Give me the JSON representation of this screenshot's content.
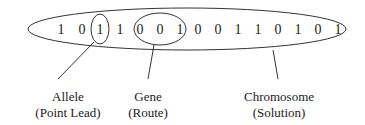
{
  "bits": [
    "1",
    "0",
    "1",
    "1",
    "0",
    "0",
    "1",
    "0",
    "0",
    "1",
    "1",
    "0",
    "1",
    "0",
    "1"
  ],
  "bit_x": [
    61,
    82,
    100,
    120,
    140,
    160,
    180,
    198,
    218,
    238,
    258,
    278,
    298,
    318,
    338
  ],
  "labels": {
    "allele": {
      "line1": "Allele",
      "line2": "(Point Lead)"
    },
    "gene": {
      "line1": "Gene",
      "line2": "(Route)"
    },
    "chromosome": {
      "line1": "Chromosome",
      "line2": "(Solution)"
    }
  },
  "colors": {
    "stroke": "#333333",
    "text": "#222222"
  }
}
